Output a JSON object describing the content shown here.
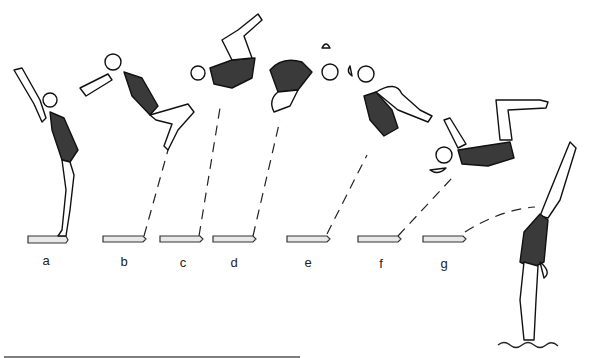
{
  "diagram": {
    "stages": [
      {
        "id": "a",
        "label": "a",
        "x": 46
      },
      {
        "id": "b",
        "label": "b",
        "x": 124
      },
      {
        "id": "c",
        "label": "c",
        "x": 183
      },
      {
        "id": "d",
        "label": "d",
        "x": 234
      },
      {
        "id": "e",
        "label": "e",
        "x": 308
      },
      {
        "id": "f",
        "label": "f",
        "x": 380
      },
      {
        "id": "g",
        "label": "g",
        "x": 444
      }
    ],
    "colors": {
      "ink": "#111111",
      "suit": "#3a3a3a",
      "background": "#ffffff"
    }
  }
}
